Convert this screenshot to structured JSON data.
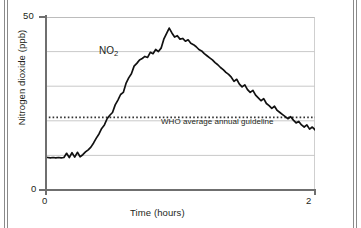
{
  "figure": {
    "background_color": "#ffffff",
    "frame_color": "#8a8a8a",
    "series_label": "NO",
    "series_label_subscript": "2"
  },
  "annotations": {
    "who_guideline_text": "WHO average annual guideline",
    "who_guideline_value": 21
  },
  "axes": {
    "y_title": "Nitrogen dioxide (ppb)",
    "x_title": "Time (hours)",
    "y_ticks": [
      "0",
      "50"
    ],
    "x_ticks": [
      "0",
      "2"
    ]
  },
  "chart_data": {
    "type": "line",
    "title": "",
    "subtitle": "",
    "xlabel": "Time (hours)",
    "ylabel": "Nitrogen dioxide (ppb)",
    "xlim": [
      0,
      2
    ],
    "ylim": [
      0,
      50
    ],
    "xticks": [
      0,
      2
    ],
    "yticks": [
      0,
      50
    ],
    "gridlines_y": [
      10,
      20,
      30,
      40
    ],
    "grid": true,
    "legend": "none",
    "line_color": "#111111",
    "annotations": [
      {
        "type": "hline",
        "label": "WHO average annual guideline",
        "value": 21,
        "style": "dotted",
        "color": "#333333"
      },
      {
        "type": "text",
        "label": "NO2",
        "x": 0.07,
        "y": 45
      }
    ],
    "series": [
      {
        "name": "NO2",
        "x": [
          0.0,
          0.02,
          0.04,
          0.06,
          0.08,
          0.1,
          0.12,
          0.14,
          0.16,
          0.18,
          0.2,
          0.22,
          0.24,
          0.26,
          0.28,
          0.3,
          0.32,
          0.34,
          0.36,
          0.38,
          0.4,
          0.42,
          0.44,
          0.46,
          0.48,
          0.5,
          0.52,
          0.54,
          0.56,
          0.58,
          0.6,
          0.62,
          0.64,
          0.66,
          0.68,
          0.7,
          0.72,
          0.74,
          0.76,
          0.78,
          0.8,
          0.82,
          0.84,
          0.86,
          0.88,
          0.9,
          0.92,
          0.94,
          0.96,
          0.98,
          1.0,
          1.02,
          1.04,
          1.06,
          1.08,
          1.1,
          1.12,
          1.14,
          1.16,
          1.18,
          1.2,
          1.22,
          1.24,
          1.26,
          1.28,
          1.3,
          1.32,
          1.34,
          1.36,
          1.38,
          1.4,
          1.42,
          1.44,
          1.46,
          1.48,
          1.5,
          1.52,
          1.54,
          1.56,
          1.58,
          1.6,
          1.62,
          1.64,
          1.66,
          1.68,
          1.7,
          1.72,
          1.74,
          1.76,
          1.78,
          1.8,
          1.82,
          1.84,
          1.86,
          1.88,
          1.9,
          1.92,
          1.94,
          1.96,
          1.98,
          2.0
        ],
        "values": [
          9.5,
          9.4,
          9.3,
          9.4,
          9.3,
          9.4,
          9.3,
          9.4,
          10.6,
          9.4,
          10.8,
          9.5,
          10.9,
          9.6,
          10.2,
          11.0,
          11.6,
          12.4,
          13.6,
          15.0,
          16.2,
          17.8,
          18.8,
          20.6,
          21.6,
          22.4,
          24.6,
          26.0,
          27.6,
          28.2,
          30.8,
          32.4,
          33.6,
          35.8,
          36.6,
          37.6,
          38.0,
          38.6,
          38.3,
          39.8,
          39.4,
          40.6,
          40.0,
          41.0,
          43.6,
          45.2,
          46.8,
          45.4,
          44.2,
          44.6,
          43.6,
          43.8,
          43.0,
          43.4,
          42.4,
          42.0,
          41.4,
          40.6,
          40.2,
          39.4,
          38.8,
          38.2,
          37.6,
          36.8,
          36.2,
          35.4,
          34.8,
          34.0,
          33.4,
          32.6,
          31.4,
          32.0,
          30.6,
          29.8,
          30.4,
          29.0,
          28.2,
          28.8,
          27.4,
          26.6,
          25.8,
          26.4,
          25.0,
          24.4,
          23.6,
          24.2,
          23.0,
          22.4,
          21.8,
          21.2,
          20.6,
          21.2,
          20.2,
          19.4,
          19.8,
          18.8,
          18.2,
          18.8,
          17.6,
          18.2,
          17.4
        ]
      }
    ]
  }
}
